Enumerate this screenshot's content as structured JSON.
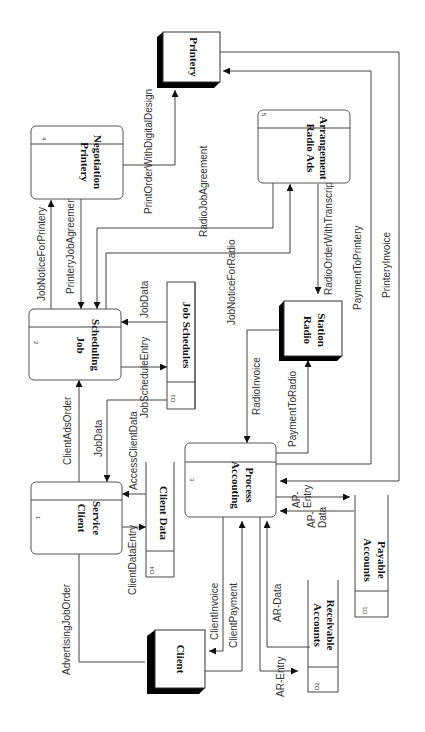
{
  "diagram": {
    "type": "data-flow-diagram",
    "orientation": "rotated 90deg clockwise",
    "processes": [
      {
        "id": "1",
        "label_line1": "Client",
        "label_line2": "Service"
      },
      {
        "id": "2",
        "label_line1": "Job",
        "label_line2": "Scheduling"
      },
      {
        "id": "3",
        "label_line1": "Accouting",
        "label_line2": "Process"
      },
      {
        "id": "4",
        "label_line1": "Printery",
        "label_line2": "Negotiation"
      },
      {
        "id": "5",
        "label_line1": "Radio Ads",
        "label_line2": "Arrangement"
      }
    ],
    "entities": [
      {
        "label_line1": "Client",
        "label_line2": ""
      },
      {
        "label_line1": "Printery",
        "label_line2": ""
      },
      {
        "label_line1": "Radio",
        "label_line2": "Station"
      }
    ],
    "stores": [
      {
        "id": "D1",
        "label_line1": "Accounts",
        "label_line2": "Payable"
      },
      {
        "id": "D2",
        "label_line1": "Accounts",
        "label_line2": "Receivable"
      },
      {
        "id": "D3",
        "label_line1": "Job Schedules",
        "label_line2": ""
      },
      {
        "id": "D4",
        "label_line1": "Client Data",
        "label_line2": ""
      }
    ],
    "flows": {
      "advertising_job_order": "AdvertisingJobOrder",
      "client_data_entry": "ClientDataEntry",
      "access_client_data": "AccessClientData",
      "client_ads_order": "ClientAdsOrder",
      "job_data_to_client_service": "JobData",
      "job_schedule_entry": "JobScheduleEntry",
      "job_data_to_job_scheduling": "JobData",
      "job_notice_for_printery": "JobNoticeForPrintery",
      "printery_job_agreement": "PrinteryJobAgreement",
      "print_order_with_digital_design": "PrintOrderWithDigitalDesign",
      "radio_job_agreement": "RadioJobAgreement",
      "job_notice_for_radio": "JobNoticeForRadio",
      "radio_order_with_transcript": "RadioOrderWithTranscript",
      "radio_invoice": "RadioInvoice",
      "payment_to_radio": "PaymentToRadio",
      "payment_to_printery": "PaymentToPrintery",
      "printery_invoice": "PrinteryInvoice",
      "client_invoice": "ClientInvoice",
      "client_payment": "ClientPayment",
      "ar_data": "AR-Data",
      "ar_entry": "AR-Entry",
      "ap_entry_line1": "AP-",
      "ap_entry_line2": "Entry",
      "ap_data_line1": "AP-",
      "ap_data_line2": "Data"
    },
    "colors": {
      "line": "#444444",
      "text": "#333333",
      "shadow": "#000000",
      "background": "#ffffff"
    }
  }
}
